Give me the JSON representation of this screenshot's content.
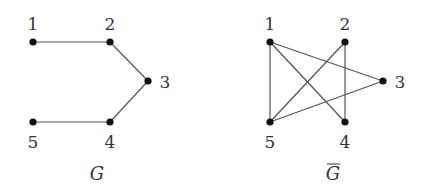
{
  "graphs": [
    {
      "id": "G",
      "caption": "G",
      "overline": false,
      "caption_pos": [
        97,
        180
      ],
      "nodes": [
        {
          "id": "1",
          "label": "1",
          "x": 33,
          "y": 42,
          "lx": 33,
          "ly": 30
        },
        {
          "id": "2",
          "label": "2",
          "x": 110,
          "y": 42,
          "lx": 110,
          "ly": 30
        },
        {
          "id": "3",
          "label": "3",
          "x": 148,
          "y": 81,
          "lx": 165,
          "ly": 88
        },
        {
          "id": "4",
          "label": "4",
          "x": 110,
          "y": 122,
          "lx": 110,
          "ly": 148
        },
        {
          "id": "5",
          "label": "5",
          "x": 33,
          "y": 122,
          "lx": 33,
          "ly": 148
        }
      ],
      "edges": [
        [
          "1",
          "2"
        ],
        [
          "2",
          "3"
        ],
        [
          "3",
          "4"
        ],
        [
          "4",
          "5"
        ]
      ]
    },
    {
      "id": "G-complement",
      "caption": "G",
      "overline": true,
      "caption_pos": [
        333,
        180
      ],
      "nodes": [
        {
          "id": "1",
          "label": "1",
          "x": 270,
          "y": 42,
          "lx": 270,
          "ly": 30
        },
        {
          "id": "2",
          "label": "2",
          "x": 345,
          "y": 42,
          "lx": 345,
          "ly": 30
        },
        {
          "id": "3",
          "label": "3",
          "x": 383,
          "y": 81,
          "lx": 400,
          "ly": 88
        },
        {
          "id": "4",
          "label": "4",
          "x": 345,
          "y": 122,
          "lx": 345,
          "ly": 148
        },
        {
          "id": "5",
          "label": "5",
          "x": 270,
          "y": 122,
          "lx": 270,
          "ly": 148
        }
      ],
      "edges": [
        [
          "1",
          "5"
        ],
        [
          "1",
          "4"
        ],
        [
          "1",
          "3"
        ],
        [
          "2",
          "5"
        ],
        [
          "2",
          "4"
        ],
        [
          "3",
          "5"
        ]
      ]
    }
  ]
}
